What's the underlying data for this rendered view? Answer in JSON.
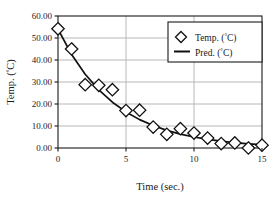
{
  "chart_data": {
    "type": "scatter",
    "title": "",
    "xlabel": "Time (sec.)",
    "ylabel": "Temp. (°C)",
    "xlim": [
      0,
      15
    ],
    "ylim": [
      0,
      60
    ],
    "grid": true,
    "legend_position": "top-right",
    "x_ticks": [
      "0",
      "5",
      "10",
      "15"
    ],
    "x_tick_values": [
      0,
      5,
      10,
      15
    ],
    "y_ticks": [
      "0.00",
      "10.00",
      "20.00",
      "30.00",
      "40.00",
      "50.00",
      "60.00"
    ],
    "y_tick_values": [
      0,
      10,
      20,
      30,
      40,
      50,
      60
    ],
    "x": [
      0,
      1,
      2,
      3,
      4,
      5,
      6,
      7,
      8,
      9,
      10,
      11,
      12,
      13,
      14,
      15
    ],
    "series": [
      {
        "name": "Temp. (°C)",
        "marker": "open-diamond",
        "color": "#111111",
        "values": [
          54.2,
          45.0,
          28.8,
          28.5,
          26.5,
          17.0,
          17.2,
          9.5,
          6.2,
          8.8,
          6.8,
          4.5,
          2.0,
          2.3,
          0.0,
          1.3
        ]
      },
      {
        "name": "Pred. (°C)",
        "marker": "line",
        "color": "#111111",
        "values": [
          54.0,
          42.5,
          33.5,
          26.4,
          20.8,
          16.4,
          12.9,
          10.2,
          8.0,
          6.3,
          5.0,
          3.9,
          3.1,
          2.4,
          1.9,
          1.5
        ]
      }
    ]
  },
  "legend": {
    "entries": [
      {
        "label_text": "Temp. (",
        "label_unit": "C)",
        "symbol": "open-diamond"
      },
      {
        "label_text": "Pred. (",
        "label_unit": "C)",
        "symbol": "line"
      }
    ]
  },
  "axes": {
    "x_title": "Time (sec.)",
    "y_title_text": "Temp. (",
    "y_title_unit": "C)"
  }
}
